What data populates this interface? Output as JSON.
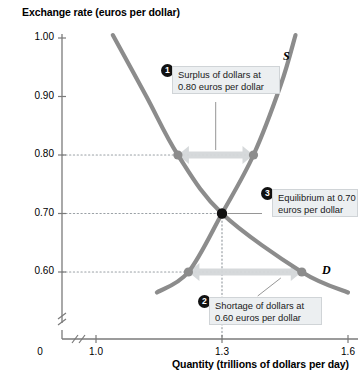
{
  "chart_data": {
    "type": "line",
    "title": "",
    "ylabel": "Exchange rate (euros per dollar)",
    "xlabel": "Quantity (trillions of dollars per day)",
    "xlim": [
      0.85,
      1.65
    ],
    "ylim": [
      0.545,
      1.02
    ],
    "grid": false,
    "legend": "inline-curve-labels",
    "y_ticks": [
      "1.00",
      "0.90",
      "0.80",
      "0.70",
      "0.60"
    ],
    "y_tick_values": [
      1.0,
      0.9,
      0.8,
      0.7,
      0.6
    ],
    "x_ticks": [
      "1.0",
      "1.3",
      "1.6"
    ],
    "x_tick_values": [
      1.0,
      1.3,
      1.6
    ],
    "origin_label": "0",
    "axis_break": true,
    "series": [
      {
        "name": "Demand",
        "label": "D",
        "color": "#8c8c8c",
        "points": [
          {
            "x": 1.04,
            "y": 1.005
          },
          {
            "x": 1.12,
            "y": 0.9
          },
          {
            "x": 1.195,
            "y": 0.8
          },
          {
            "x": 1.3,
            "y": 0.7
          },
          {
            "x": 1.49,
            "y": 0.6
          },
          {
            "x": 1.6,
            "y": 0.565
          }
        ]
      },
      {
        "name": "Supply",
        "label": "S",
        "color": "#8c8c8c",
        "points": [
          {
            "x": 1.145,
            "y": 0.565
          },
          {
            "x": 1.22,
            "y": 0.6
          },
          {
            "x": 1.3,
            "y": 0.7
          },
          {
            "x": 1.375,
            "y": 0.8
          },
          {
            "x": 1.44,
            "y": 0.92
          },
          {
            "x": 1.475,
            "y": 1.005
          }
        ]
      }
    ],
    "markers": [
      {
        "name": "demand-at-0.80",
        "x": 1.195,
        "y": 0.8,
        "color": "#8c8c8c"
      },
      {
        "name": "supply-at-0.80",
        "x": 1.375,
        "y": 0.8,
        "color": "#8c8c8c"
      },
      {
        "name": "equilibrium",
        "x": 1.3,
        "y": 0.7,
        "color": "#111111"
      },
      {
        "name": "supply-at-0.60",
        "x": 1.22,
        "y": 0.6,
        "color": "#8c8c8c"
      },
      {
        "name": "demand-at-0.60",
        "x": 1.49,
        "y": 0.6,
        "color": "#8c8c8c"
      }
    ],
    "guide_lines": [
      {
        "name": "guide-0.80",
        "type": "horizontal",
        "y": 0.8
      },
      {
        "name": "guide-0.70",
        "type": "horizontal",
        "y": 0.7
      },
      {
        "name": "guide-0.60",
        "type": "horizontal",
        "y": 0.6
      },
      {
        "name": "guide-1.3",
        "type": "vertical",
        "x": 1.3
      }
    ],
    "gap_arrows": [
      {
        "name": "surplus-arrow",
        "y": 0.8,
        "x_from": 1.195,
        "x_to": 1.375,
        "color": "#d4d7d9"
      },
      {
        "name": "shortage-arrow",
        "y": 0.6,
        "x_from": 1.22,
        "x_to": 1.49,
        "color": "#d4d7d9"
      }
    ],
    "annotations": [
      {
        "number": "1",
        "line1": "Surplus of dollars at",
        "line2": "0.80 euros per dollar"
      },
      {
        "number": "2",
        "line1": "Shortage of dollars at",
        "line2": "0.60 euros per dollar"
      },
      {
        "number": "3",
        "line1": "Equilibrium at 0.70",
        "line2": "euros per dollar"
      }
    ]
  }
}
